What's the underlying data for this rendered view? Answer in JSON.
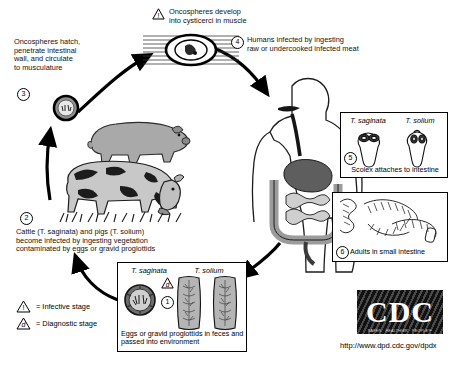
{
  "steps": {
    "s1": {
      "num": "1",
      "title_left": "T. saginata",
      "title_right": "T. solium",
      "caption": "Eggs or gravid proglottids in feces and passed into environment",
      "marker": "diagnostic"
    },
    "s2": {
      "num": "2",
      "text": "Cattle (T. saginata) and pigs (T. solium) become infected by ingesting vegetation contaminated by eggs or gravid proglottids",
      "line1": "Cattle (T. saginata) and pigs (T. solium)",
      "line2": "become infected by ingesting vegetation",
      "line3": "contaminated by eggs or gravid proglottids"
    },
    "s3": {
      "num": "3",
      "line1": "Oncospheres hatch,",
      "line2": "penetrate intestinal",
      "line3": "wall, and circulate",
      "line4": "to musculature"
    },
    "s4": {
      "num": "4",
      "line1": "Humans infected by ingesting",
      "line2": "raw or undercooked infected meat"
    },
    "s5": {
      "num": "5",
      "title_left": "T. saginata",
      "title_right": "T. solium",
      "caption": "Scolex attaches to intestine"
    },
    "s6": {
      "num": "6",
      "caption": "Adults in small intestine"
    },
    "top": {
      "line1": "Oncospheres develop",
      "line2": "into cysticerci in muscle",
      "marker": "infective"
    }
  },
  "legend": {
    "infective": {
      "symbol": "!",
      "label": "= Infective stage"
    },
    "diagnostic": {
      "symbol": "d",
      "label": "= Diagnostic stage"
    }
  },
  "branding": {
    "logo_text": "CDC",
    "tagline": "SAFER · HEALTHIER · PEOPLE™",
    "url": "http://www.dpd.cdc.gov/dpdx"
  },
  "colors": {
    "ink": "#000000",
    "pig": "#a9a9a9",
    "cow_light": "#c8c8c8",
    "organ_dark": "#5e5e5e",
    "organ_mid": "#9b9b9b",
    "organ_light": "#cfcfcf",
    "proglottid": "#b5b5b5"
  }
}
